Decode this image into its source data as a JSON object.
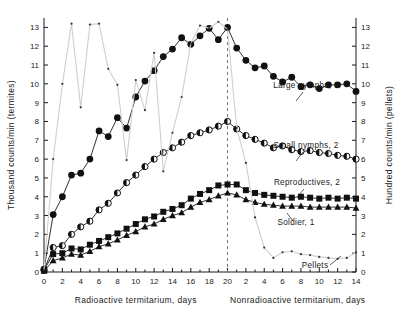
{
  "chart_data": {
    "type": "line",
    "title": "",
    "ylabel": "Thousand counts/min (termites)",
    "ylabel_right": "Hundred counts/min (pellets)",
    "xlabel_left": "Radioactive  termitarium, days",
    "xlabel_right": "Nonradioactive  termitarium, days",
    "ylim": [
      0,
      13.5
    ],
    "yticks": [
      0,
      1,
      2,
      3,
      4,
      5,
      6,
      7,
      8,
      9,
      10,
      11,
      12,
      13
    ],
    "ylim_right": [
      0,
      13.5
    ],
    "yticks_right": [
      0,
      1,
      2,
      3,
      4,
      5,
      6,
      7,
      8,
      9,
      10,
      11,
      12,
      13
    ],
    "xticks_left": [
      0,
      2,
      4,
      6,
      8,
      10,
      12,
      14,
      16,
      18,
      20
    ],
    "xticks_right": [
      2,
      4,
      6,
      8,
      10,
      12,
      14
    ],
    "xlim_left": [
      0,
      20
    ],
    "xlim_right": [
      0,
      14
    ],
    "grid": false,
    "legend_position": "inline-right",
    "divider_day": 20,
    "divider_style": "dashed",
    "series": [
      {
        "name": "Large nymphs, 3",
        "marker": "filled-circle",
        "axis": "left",
        "x": [
          0,
          1,
          2,
          3,
          4,
          5,
          6,
          7,
          8,
          9,
          10,
          11,
          12,
          13,
          14,
          15,
          16,
          17,
          18,
          19,
          20,
          21,
          22,
          23,
          24,
          25,
          26,
          27,
          28,
          29,
          30,
          31,
          32,
          33,
          34
        ],
        "values": [
          0.15,
          3.05,
          4.0,
          5.15,
          5.25,
          6.0,
          7.5,
          7.2,
          8.2,
          7.65,
          9.3,
          10.15,
          10.7,
          11.45,
          11.85,
          12.45,
          12.1,
          12.55,
          12.95,
          12.35,
          13.0,
          11.9,
          11.25,
          10.85,
          10.95,
          10.4,
          10.1,
          10.35,
          9.85,
          9.95,
          9.75,
          9.95,
          9.95,
          10.0,
          9.6
        ]
      },
      {
        "name": "Small nymphs, 2",
        "marker": "half-filled-circle",
        "axis": "left",
        "x": [
          0,
          1,
          2,
          3,
          4,
          5,
          6,
          7,
          8,
          9,
          10,
          11,
          12,
          13,
          14,
          15,
          16,
          17,
          18,
          19,
          20,
          21,
          22,
          23,
          24,
          25,
          26,
          27,
          28,
          29,
          30,
          31,
          32,
          33,
          34
        ],
        "values": [
          0.1,
          1.3,
          1.4,
          2.0,
          2.4,
          2.7,
          3.3,
          3.65,
          4.2,
          4.75,
          5.15,
          5.6,
          6.0,
          6.35,
          6.6,
          6.9,
          7.25,
          7.4,
          7.55,
          7.75,
          8.0,
          7.6,
          7.25,
          7.05,
          6.85,
          6.6,
          6.7,
          6.5,
          6.4,
          6.45,
          6.35,
          6.3,
          6.2,
          6.15,
          6.0
        ]
      },
      {
        "name": "Reproductives, 2",
        "marker": "filled-square",
        "axis": "left",
        "x": [
          0,
          1,
          2,
          3,
          4,
          5,
          6,
          7,
          8,
          9,
          10,
          11,
          12,
          13,
          14,
          15,
          16,
          17,
          18,
          19,
          20,
          21,
          22,
          23,
          24,
          25,
          26,
          27,
          28,
          29,
          30,
          31,
          32,
          33,
          34
        ],
        "values": [
          0.1,
          0.95,
          1.0,
          1.25,
          1.2,
          1.45,
          1.65,
          1.85,
          2.05,
          2.3,
          2.55,
          2.8,
          2.95,
          3.2,
          3.35,
          3.55,
          3.9,
          4.15,
          4.35,
          4.6,
          4.65,
          4.65,
          4.35,
          4.2,
          4.1,
          4.05,
          4.0,
          3.95,
          4.0,
          3.95,
          3.9,
          3.95,
          3.9,
          3.95,
          3.9
        ]
      },
      {
        "name": "Soldier, 1",
        "marker": "filled-triangle",
        "axis": "left",
        "x": [
          0,
          1,
          2,
          3,
          4,
          5,
          6,
          7,
          8,
          9,
          10,
          11,
          12,
          13,
          14,
          15,
          16,
          17,
          18,
          19,
          20,
          21,
          22,
          23,
          24,
          25,
          26,
          27,
          28,
          29,
          30,
          31,
          32,
          33,
          34
        ],
        "values": [
          0.05,
          0.6,
          0.75,
          0.95,
          0.9,
          1.1,
          1.35,
          1.5,
          1.7,
          1.95,
          2.15,
          2.4,
          2.55,
          2.8,
          3.0,
          3.15,
          3.45,
          3.7,
          3.85,
          4.05,
          4.2,
          4.1,
          3.85,
          3.7,
          3.6,
          3.55,
          3.5,
          3.5,
          3.5,
          3.45,
          3.45,
          3.45,
          3.45,
          3.45,
          3.4
        ]
      },
      {
        "name": "Pellets",
        "marker": "small-dot",
        "axis": "right",
        "x": [
          0,
          1,
          2,
          3,
          4,
          5,
          6,
          7,
          8,
          9,
          10,
          11,
          12,
          13,
          14,
          15,
          16,
          17,
          18,
          19,
          20,
          21,
          22,
          23,
          24,
          25,
          26,
          27,
          28,
          29,
          30,
          31,
          32,
          33,
          34
        ],
        "values": [
          0.1,
          6.0,
          10.0,
          13.2,
          8.75,
          13.15,
          13.2,
          10.8,
          9.95,
          5.95,
          10.2,
          8.6,
          11.65,
          5.35,
          7.4,
          9.3,
          12.15,
          13.1,
          12.95,
          13.3,
          12.9,
          7.65,
          5.8,
          2.9,
          1.3,
          0.75,
          1.05,
          1.1,
          0.95,
          0.9,
          0.8,
          0.75,
          0.7,
          0.75,
          1.05
        ]
      }
    ]
  }
}
